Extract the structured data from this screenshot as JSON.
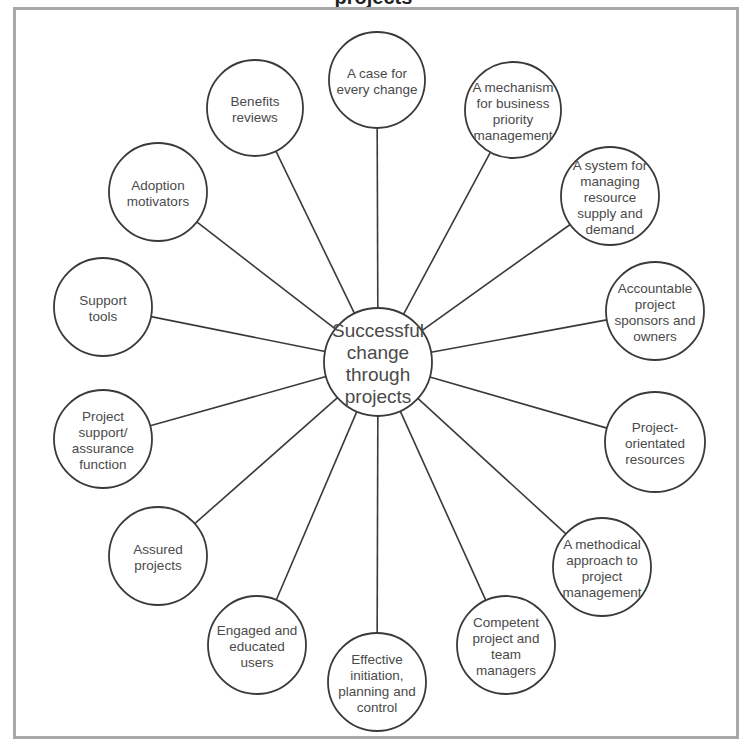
{
  "diagram": {
    "title_partial": "projects",
    "center": {
      "label_lines": [
        "Successful",
        "change",
        "through",
        "projects"
      ],
      "x": 378,
      "y": 362,
      "r": 54
    },
    "nodes": [
      {
        "id": "case-for-change",
        "label_lines": [
          "A case for",
          "every change"
        ],
        "x": 377,
        "y": 80,
        "r": 48
      },
      {
        "id": "business-priority",
        "label_lines": [
          "A mechanism",
          "for business",
          "priority",
          "management"
        ],
        "x": 513,
        "y": 110,
        "r": 48
      },
      {
        "id": "resource-supply",
        "label_lines": [
          "A system for",
          "managing",
          "resource",
          "supply and",
          "demand"
        ],
        "x": 610,
        "y": 196,
        "r": 49
      },
      {
        "id": "accountable-sponsors",
        "label_lines": [
          "Accountable",
          "project",
          "sponsors and",
          "owners"
        ],
        "x": 655,
        "y": 311,
        "r": 49
      },
      {
        "id": "project-orientated",
        "label_lines": [
          "Project-",
          "orientated",
          "resources"
        ],
        "x": 655,
        "y": 442,
        "r": 50
      },
      {
        "id": "methodical-approach",
        "label_lines": [
          "A methodical",
          "approach to",
          "project",
          "management"
        ],
        "x": 602,
        "y": 567,
        "r": 49
      },
      {
        "id": "competent-managers",
        "label_lines": [
          "Competent",
          "project and",
          "team",
          "managers"
        ],
        "x": 506,
        "y": 645,
        "r": 49
      },
      {
        "id": "effective-initiation",
        "label_lines": [
          "Effective",
          "initiation,",
          "planning and",
          "control"
        ],
        "x": 377,
        "y": 682,
        "r": 49
      },
      {
        "id": "engaged-users",
        "label_lines": [
          "Engaged and",
          "educated",
          "users"
        ],
        "x": 257,
        "y": 645,
        "r": 49
      },
      {
        "id": "assured-projects",
        "label_lines": [
          "Assured",
          "projects"
        ],
        "x": 158,
        "y": 556,
        "r": 49
      },
      {
        "id": "project-support",
        "label_lines": [
          "Project",
          "support/",
          "assurance",
          "function"
        ],
        "x": 103,
        "y": 439,
        "r": 49
      },
      {
        "id": "support-tools",
        "label_lines": [
          "Support",
          "tools"
        ],
        "x": 103,
        "y": 307,
        "r": 49
      },
      {
        "id": "adoption-motivators",
        "label_lines": [
          "Adoption",
          "motivators"
        ],
        "x": 158,
        "y": 192,
        "r": 49
      },
      {
        "id": "benefits-reviews",
        "label_lines": [
          "Benefits",
          "reviews"
        ],
        "x": 255,
        "y": 108,
        "r": 48
      }
    ],
    "colors": {
      "stroke": "#3a3a3a",
      "text": "#4a4a4a",
      "frame": "#a8a8a8",
      "background": "#ffffff"
    }
  }
}
